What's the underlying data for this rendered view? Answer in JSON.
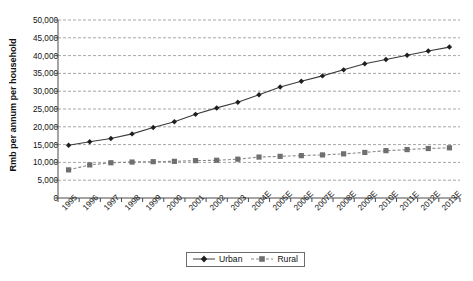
{
  "chart_data": {
    "type": "line",
    "title": "",
    "xlabel": "",
    "ylabel": "Rmb per annum per household",
    "ylim": [
      0,
      50000
    ],
    "ytick_step": 5000,
    "grid": true,
    "legend_position": "bottom-center",
    "categories": [
      "1995",
      "1996",
      "1997",
      "1998",
      "1999",
      "2000",
      "2001",
      "2002",
      "2003",
      "2004E",
      "2005E",
      "2006E",
      "2007E",
      "2008E",
      "2009E",
      "2010E",
      "2011E",
      "2012E",
      "2013E"
    ],
    "ytick_labels": [
      "50,000",
      "45,000",
      "40,000",
      "35,000",
      "30,000",
      "25,000",
      "20,000",
      "15,000",
      "10,000",
      "5,000",
      "0"
    ],
    "ytick_values": [
      50000,
      45000,
      40000,
      35000,
      30000,
      25000,
      20000,
      15000,
      10000,
      5000,
      0
    ],
    "series": [
      {
        "name": "Urban",
        "marker": "diamond",
        "line_style": "solid",
        "color": "#3a3a3a",
        "values": [
          14800,
          15800,
          16700,
          18000,
          19800,
          21400,
          23500,
          25300,
          26900,
          29000,
          31200,
          32800,
          34300,
          36000,
          37700,
          38900,
          40100,
          41300,
          42400
        ]
      },
      {
        "name": "Rural",
        "marker": "square",
        "line_style": "dashed",
        "color": "#8a8a8a",
        "values": [
          7900,
          9300,
          9900,
          10100,
          10200,
          10300,
          10500,
          10600,
          10900,
          11500,
          11700,
          11900,
          12100,
          12400,
          12800,
          13300,
          13600,
          13900,
          14100
        ]
      }
    ]
  },
  "legend": {
    "items": [
      {
        "label": "Urban",
        "marker": "diamond"
      },
      {
        "label": "Rural",
        "marker": "square"
      }
    ]
  }
}
